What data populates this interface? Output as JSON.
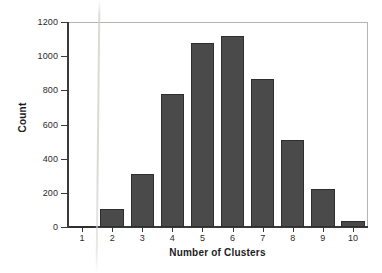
{
  "chart_data": {
    "type": "bar",
    "title": "",
    "xlabel": "Number of Clusters",
    "ylabel": "Count",
    "categories": [
      "1",
      "2",
      "3",
      "4",
      "5",
      "6",
      "7",
      "8",
      "9",
      "10"
    ],
    "values": [
      5,
      105,
      310,
      780,
      1075,
      1120,
      865,
      510,
      220,
      35
    ],
    "ylim": [
      0,
      1200
    ],
    "yticks": [
      0,
      200,
      400,
      600,
      800,
      1000,
      1200
    ],
    "ytick_labels": [
      "0",
      "200",
      "400",
      "600",
      "800",
      "1000",
      "1200"
    ],
    "grid": false,
    "legend": "none",
    "series": [
      {
        "name": "Count",
        "values": [
          5,
          105,
          310,
          780,
          1075,
          1120,
          865,
          510,
          220,
          35
        ]
      }
    ],
    "colors": {
      "bar_fill": "#4a4a4a",
      "bar_edge": "#2e2e2e",
      "axis": "#3a3a3a",
      "frame": "#b4b4b4",
      "background": "#ffffff",
      "text": "#1c1c1c"
    }
  }
}
